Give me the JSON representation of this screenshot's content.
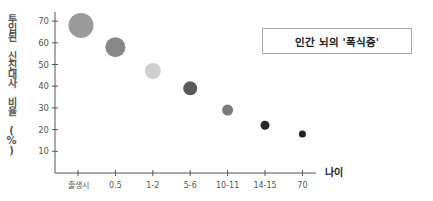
{
  "chart_data": {
    "type": "scatter",
    "title": "인간 뇌의 '폭식증'",
    "xlabel": "나이",
    "ylabel": "투입된 신진대사 비율 (%)",
    "categories": [
      "출생시",
      "0.5",
      "1-2",
      "5-6",
      "10-11",
      "14-15",
      "70"
    ],
    "series": [
      {
        "name": "신진대사 비율",
        "values": [
          68,
          58,
          47,
          39,
          29,
          22,
          18
        ],
        "bubble_radius": [
          12.5,
          10,
          8,
          7,
          5.5,
          4.5,
          3.5
        ],
        "colors": [
          "#9b9b9b",
          "#888888",
          "#cfcfcf",
          "#595959",
          "#7a7a7a",
          "#262626",
          "#222222"
        ]
      }
    ],
    "yticks": [
      10,
      20,
      30,
      40,
      50,
      60,
      70
    ],
    "ylim": [
      0,
      75
    ],
    "grid": false,
    "legend": "none"
  },
  "labels": {
    "title": "인간 뇌의 '폭식증'",
    "xlabel": "나이",
    "ylabel": "투입된 신진대사 비율 (%)"
  }
}
